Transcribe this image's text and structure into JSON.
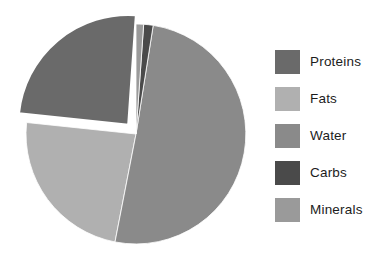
{
  "chart_data": {
    "type": "pie",
    "title": "",
    "subtitle": "",
    "xlabel": "",
    "ylabel": "",
    "grid": false,
    "legend_position": "right",
    "start_angle_deg": 0,
    "direction": "clockwise",
    "center": {
      "x": 136,
      "y": 134
    },
    "radius": 110,
    "categories": [
      "Proteins",
      "Fats",
      "Water",
      "Carbs",
      "Minerals"
    ],
    "values": [
      24.5,
      23.5,
      50.3,
      0.6,
      1.1
    ],
    "units": "percent",
    "slices": [
      {
        "label": "Proteins",
        "value": 24.5,
        "color": "#6a6a6a",
        "start_deg": 276.0,
        "end_deg": 364.0,
        "exploded": true,
        "explode_offset": 12,
        "explode_direction_deg": 320
      },
      {
        "label": "Fats",
        "value": 23.5,
        "color": "#b0b0b0",
        "start_deg": 191.0,
        "end_deg": 276.0,
        "exploded": false,
        "explode_offset": 0,
        "explode_direction_deg": 0
      },
      {
        "label": "Water",
        "value": 50.3,
        "color": "#8a8a8a",
        "start_deg": 9.0,
        "end_deg": 191.0,
        "exploded": false,
        "explode_offset": 0,
        "explode_direction_deg": 0
      },
      {
        "label": "Carbs",
        "value": 0.6,
        "color": "#4a4a4a",
        "start_deg": 4.0,
        "end_deg": 9.0,
        "exploded": false,
        "explode_offset": 0,
        "explode_direction_deg": 0
      },
      {
        "label": "Minerals",
        "value": 1.1,
        "color": "#9a9a9a",
        "start_deg": 0.0,
        "end_deg": 4.0,
        "exploded": false,
        "explode_offset": 0,
        "explode_direction_deg": 0
      }
    ],
    "background_color": "#ffffff",
    "separator_color": "#ffffff"
  },
  "legend": {
    "entries": [
      {
        "label": "Proteins",
        "color": "#6a6a6a"
      },
      {
        "label": "Fats",
        "color": "#b0b0b0"
      },
      {
        "label": "Water",
        "color": "#8a8a8a"
      },
      {
        "label": "Carbs",
        "color": "#4a4a4a"
      },
      {
        "label": "Minerals",
        "color": "#9a9a9a"
      }
    ]
  }
}
